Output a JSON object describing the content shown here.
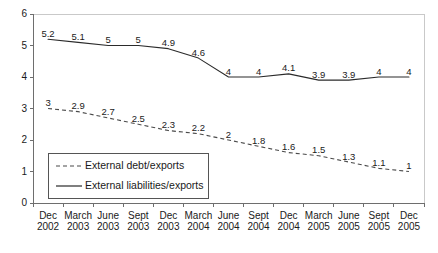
{
  "chart_data": {
    "type": "line",
    "title": "",
    "xlabel": "",
    "ylabel": "",
    "ylim": [
      0,
      6
    ],
    "yticks": [
      "0",
      "1",
      "2",
      "3",
      "4",
      "5",
      "6"
    ],
    "grid": false,
    "legend_position": "inside-bottom-left",
    "categories": [
      "Dec 2002",
      "March 2003",
      "June 2003",
      "Sept 2003",
      "Dec 2003",
      "March 2004",
      "June 2004",
      "Sept 2004",
      "Dec 2004",
      "March 2005",
      "June 2005",
      "Sept 2005",
      "Dec 2005"
    ],
    "category_lines": [
      [
        "Dec",
        "2002"
      ],
      [
        "March",
        "2003"
      ],
      [
        "June",
        "2003"
      ],
      [
        "Sept",
        "2003"
      ],
      [
        "Dec",
        "2003"
      ],
      [
        "March",
        "2004"
      ],
      [
        "June",
        "2004"
      ],
      [
        "Sept",
        "2004"
      ],
      [
        "Dec",
        "2004"
      ],
      [
        "March",
        "2005"
      ],
      [
        "June",
        "2005"
      ],
      [
        "Sept",
        "2005"
      ],
      [
        "Dec",
        "2005"
      ]
    ],
    "series": [
      {
        "name": "External debt/exports",
        "style": "dashed",
        "color": "#4a4a4a",
        "values": [
          3,
          2.9,
          2.7,
          2.5,
          2.3,
          2.2,
          2,
          1.8,
          1.6,
          1.5,
          1.3,
          1.1,
          1
        ],
        "labels": [
          "3",
          "2.9",
          "2.7",
          "2.5",
          "2.3",
          "2.2",
          "2",
          "1.8",
          "1.6",
          "1.5",
          "1.3",
          "1.1",
          "1"
        ]
      },
      {
        "name": "External liabilities/exports",
        "style": "solid",
        "color": "#2b2b2b",
        "values": [
          5.2,
          5.1,
          5,
          5,
          4.9,
          4.6,
          4,
          4,
          4.1,
          3.9,
          3.9,
          4,
          4
        ],
        "labels": [
          "5.2",
          "5.1",
          "5",
          "5",
          "4.9",
          "4.6",
          "4",
          "4",
          "4.1",
          "3.9",
          "3.9",
          "4",
          "4"
        ]
      }
    ],
    "legend": [
      {
        "label": "External debt/exports",
        "style": "dashed"
      },
      {
        "label": "External liabilities/exports",
        "style": "solid"
      }
    ]
  }
}
